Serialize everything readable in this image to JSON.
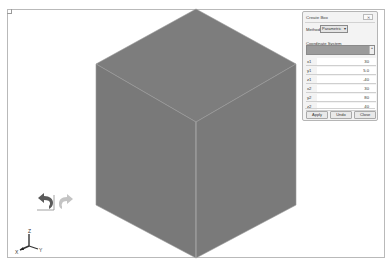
{
  "viewport": {
    "model_shape": "box",
    "colors": {
      "face": "#7b7b7b",
      "edge": "#a8a8a8",
      "frame": "#b9b9b9"
    }
  },
  "toolbar_icons": {
    "undo": "undo-arrow-icon",
    "redo": "redo-arrow-icon"
  },
  "triad": {
    "z_label": "Z",
    "x_label": "X",
    "y_label": "Y"
  },
  "dialog": {
    "title": "Create Box",
    "close_glyph": "✕",
    "method_label": "Method",
    "method_value": "Parametric",
    "coordinate_system_label": "Coordinate System",
    "fields": [
      {
        "label": "x1",
        "value": "30"
      },
      {
        "label": "y1",
        "value": "5.0"
      },
      {
        "label": "z1",
        "value": "-40"
      },
      {
        "label": "x2",
        "value": "30"
      },
      {
        "label": "y2",
        "value": "80"
      },
      {
        "label": "z2",
        "value": "40"
      }
    ],
    "buttons": {
      "apply": "Apply",
      "undo": "Undo",
      "close": "Close"
    }
  }
}
